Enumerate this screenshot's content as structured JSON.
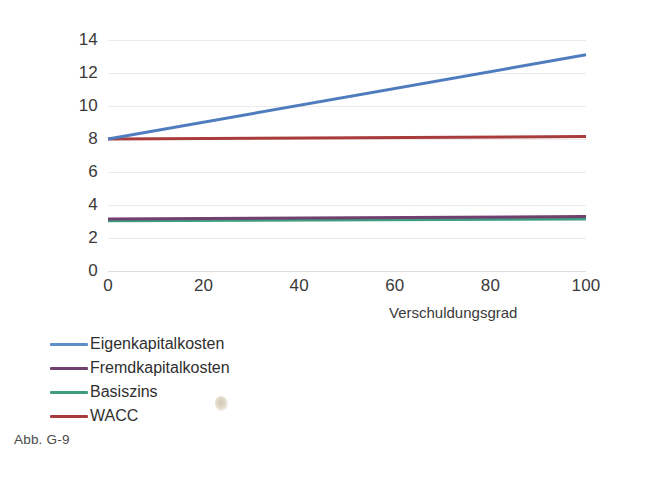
{
  "caption": "Abb. G-9",
  "chart_data": {
    "type": "line",
    "title": "",
    "xlabel": "Verschuldungsgrad",
    "ylabel": "",
    "xlim": [
      0,
      100
    ],
    "ylim": [
      0,
      14
    ],
    "x_ticks": [
      0,
      20,
      40,
      60,
      80,
      100
    ],
    "y_ticks": [
      0,
      2,
      4,
      6,
      8,
      10,
      12,
      14
    ],
    "x_tick_labels": [
      "0",
      "20",
      "40",
      "60",
      "80",
      "100"
    ],
    "y_tick_labels": [
      "0",
      "2",
      "4",
      "6",
      "8",
      "10",
      "12",
      "14"
    ],
    "grid": "horizontal",
    "legend_position": "below-left",
    "x": [
      0,
      100
    ],
    "series": [
      {
        "name": "Eigenkapitalkosten",
        "color": "#4f7cbf",
        "values": [
          8.0,
          13.1
        ]
      },
      {
        "name": "Fremdkapitalkosten",
        "color": "#70406f",
        "values": [
          3.15,
          3.3
        ]
      },
      {
        "name": "Basiszins",
        "color": "#3f9c80",
        "values": [
          3.05,
          3.15
        ]
      },
      {
        "name": "WACC",
        "color": "#a83c3c",
        "values": [
          8.0,
          8.15
        ]
      }
    ]
  },
  "axis": {
    "x_title": "Verschuldungsgrad"
  },
  "legend": {
    "items": [
      {
        "label": "Eigenkapitalkosten",
        "color": "#5b8fc9"
      },
      {
        "label": "Fremdkapitalkosten",
        "color": "#70406f"
      },
      {
        "label": "Basiszins",
        "color": "#3f9c80"
      },
      {
        "label": "WACC",
        "color": "#a83c3c"
      }
    ]
  },
  "colors": {
    "gridline": "#eceaea",
    "axis": "#dedcdc",
    "text": "#2b2b2b",
    "background": "#ffffff"
  }
}
